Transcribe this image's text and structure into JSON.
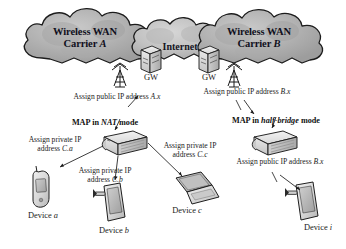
{
  "diagram": {
    "type": "network-architecture",
    "background": "#ffffff",
    "clouds": [
      {
        "id": "carrier-a",
        "line1": "Wireless WAN",
        "line2_prefix": "Carrier ",
        "line2_italic": "A"
      },
      {
        "id": "internet",
        "label": "Internet"
      },
      {
        "id": "carrier-b",
        "line1": "Wireless WAN",
        "line2_prefix": "Carrier ",
        "line2_italic": "B"
      }
    ],
    "gateways": [
      {
        "id": "gw-left",
        "label": "GW"
      },
      {
        "id": "gw-right",
        "label": "GW"
      }
    ],
    "public_assignments": [
      {
        "id": "assign-a",
        "text_prefix": "Assign public IP address ",
        "text_italic": "A.x"
      },
      {
        "id": "assign-b-top",
        "text_prefix": "Assign public IP address ",
        "text_italic": "B.x"
      }
    ],
    "maps": [
      {
        "id": "map-nat",
        "prefix": "MAP in ",
        "italic": "NAT",
        "suffix": " mode"
      },
      {
        "id": "map-half-bridge",
        "prefix": "MAP in ",
        "italic": "half-bridge",
        "suffix": " mode"
      }
    ],
    "private_assignments": [
      {
        "id": "assign-c-a",
        "line1": "Assign private IP",
        "line2_prefix": "address ",
        "line2_italic": "C.a"
      },
      {
        "id": "assign-c-b",
        "line1": "Assign private IP",
        "line2_prefix": "address ",
        "line2_italic": "C.b"
      },
      {
        "id": "assign-c-c",
        "line1": "Assign private IP",
        "line2_prefix": "address ",
        "line2_italic": "C.c"
      }
    ],
    "public_assignment_right": {
      "id": "assign-b-bottom",
      "text_prefix": "Assign public IP address ",
      "text_italic": "B.x"
    },
    "devices": [
      {
        "id": "device-a",
        "prefix": "Device ",
        "italic": "a",
        "kind": "mobile-phone"
      },
      {
        "id": "device-b",
        "prefix": "Device ",
        "italic": "b",
        "kind": "tablet"
      },
      {
        "id": "device-c",
        "prefix": "Device ",
        "italic": "c",
        "kind": "laptop"
      },
      {
        "id": "device-i",
        "prefix": "Device ",
        "italic": "i",
        "kind": "tablet"
      }
    ],
    "colors": {
      "cloud_fill": "#b8b8b8",
      "cloud_fill_light": "#d2d2d2",
      "cloud_stroke": "#1c1c1c",
      "device_fill": "#d9d9d9",
      "device_stroke": "#1e1e1e",
      "line": "#1a1a1a",
      "text": "#1a1a1a"
    }
  }
}
